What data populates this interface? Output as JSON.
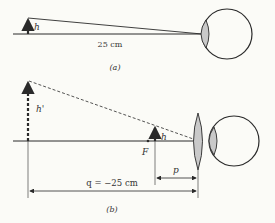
{
  "figure_a": {
    "object_label": "h",
    "distance_label": "25 cm",
    "caption": "(a)"
  },
  "figure_b": {
    "image_label": "h'",
    "object_label": "h",
    "focal_label": "F",
    "p_label": "p",
    "q_label": "q = −25 cm",
    "caption": "(b)"
  },
  "colors": {
    "line": "#2a2a2a",
    "lens_fill": "#c9c9c9",
    "background": "#fbfbf7"
  }
}
